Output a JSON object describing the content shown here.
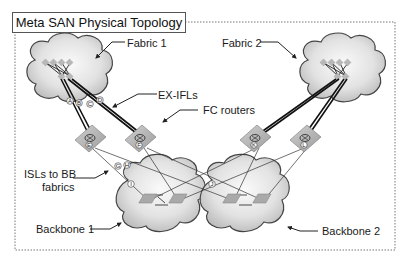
{
  "title": "Meta SAN Physical Topology",
  "labels": {
    "fabric1": "Fabric 1",
    "fabric2": "Fabric 2",
    "ex_ifls": "EX-IFLs",
    "fc_routers": "FC routers",
    "isls_line1": "ISLs to BB",
    "isls_line2": "fabrics",
    "backbone1": "Backbone 1",
    "backbone2": "Backbone 2"
  },
  "link_markers": {
    "A": "A",
    "B": "B",
    "C": "C",
    "D": "D",
    "G": "G",
    "H": "H"
  },
  "routers": {
    "E": "E",
    "F": "F",
    "K": "K",
    "L": "L"
  },
  "backbone_markers": {
    "I": "I",
    "J": "J"
  },
  "colors": {
    "cloud_fill_light": "#f4f4f4",
    "cloud_fill_dark": "#c8c8c8",
    "router_fill": "#b4b4b4",
    "switch_fill": "#bdbdbd",
    "frame": "#666666",
    "line": "#222222"
  }
}
